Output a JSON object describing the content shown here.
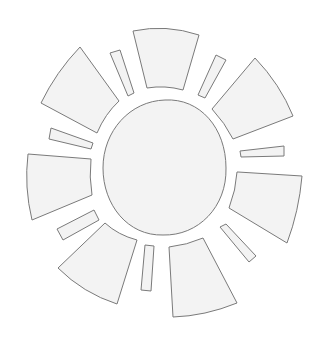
{
  "illustration": {
    "subject": "sun",
    "style": "line-art coloring page",
    "colors": {
      "background": "#ffffff",
      "fill": "#f3f3f3",
      "stroke": "#7a7a7a"
    },
    "center": {
      "name": "sun-disc",
      "path": "M165,100 C200,98 226,128 226,168 C227,207 198,236 163,235 C128,236 103,205 103,168 C103,131 130,101 165,100 Z"
    },
    "large_rays": [
      {
        "name": "ray-top",
        "path": "M133,31 Q166,24 199,35 L183,90 Q165,85 147,88 Z"
      },
      {
        "name": "ray-upper-right",
        "path": "M255,58 Q280,84 293,116 L233,139 Q225,123 212,109 Z"
      },
      {
        "name": "ray-right",
        "path": "M238,172 L302,176 Q299,211 287,243 L229,208 Q236,190 237,172 Z"
      },
      {
        "name": "ray-bottom",
        "path": "M169,247 Q187,245 203,238 L237,303 Q205,316 173,317 Z"
      },
      {
        "name": "ray-lower-left",
        "path": "M105,223 Q118,235 137,240 L117,304 Q83,293 58,268 Z"
      },
      {
        "name": "ray-left",
        "path": "M28,154 L91,159 Q89,177 92,195 L32,220 Q24,187 28,154 Z"
      },
      {
        "name": "ray-upper-left",
        "path": "M80,47 L119,101 Q105,114 97,133 L41,103 Q56,72 80,47 Z"
      }
    ],
    "small_rays": [
      {
        "name": "bar-top-left",
        "path": "M110,53 L120,50 L134,93 L128,96 Z"
      },
      {
        "name": "bar-top-right",
        "path": "M216,55 L226,60 L205,98 L198,95 Z"
      },
      {
        "name": "bar-right",
        "path": "M240,151 L284,146 L284,156 L241,157 Z"
      },
      {
        "name": "bar-lower-right",
        "path": "M220,227 L226,224 L256,256 L249,262 Z"
      },
      {
        "name": "bar-bottom",
        "path": "M145,245 L154,246 L151,291 L141,290 Z"
      },
      {
        "name": "bar-lower-left",
        "path": "M57,229 L94,210 L99,220 L63,240 Z"
      },
      {
        "name": "bar-left",
        "path": "M51,128 L93,143 L91,149 L49,139 Z"
      }
    ]
  }
}
